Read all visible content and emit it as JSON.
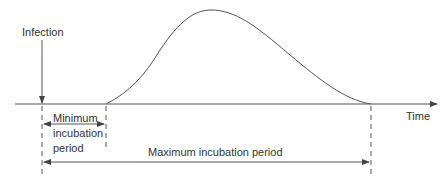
{
  "diagram": {
    "labels": {
      "infection": "Infection",
      "time": "Time",
      "min_line1": "Minimum",
      "min_line2": "incubation",
      "min_line3": "period",
      "maximum": "Maximum incubation period"
    },
    "colors": {
      "line": "#555555",
      "text": "#333333"
    }
  }
}
